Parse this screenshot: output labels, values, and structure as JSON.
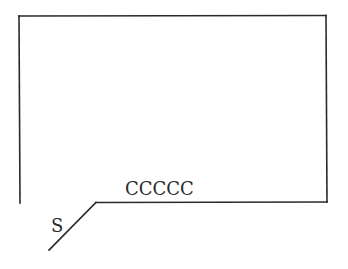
{
  "diagram": {
    "labels": {
      "top_edge_label": "CCCCC",
      "diagonal_label": "S"
    },
    "colors": {
      "stroke": "#2a2a2a",
      "background": "#ffffff"
    }
  }
}
